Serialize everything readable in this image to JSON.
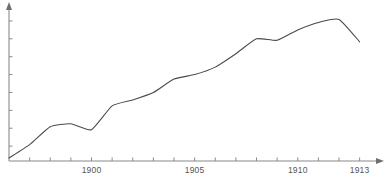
{
  "chart_data": {
    "type": "line",
    "title": "",
    "subtitle": "",
    "xlabel": "",
    "ylabel": "",
    "legend": [],
    "legend_position": "none",
    "grid": false,
    "xlim": [
      1896,
      1913.6
    ],
    "ylim": [
      0,
      100
    ],
    "x_tick_labels": [
      "1900",
      "1905",
      "1910",
      "1913"
    ],
    "x_tick_values": [
      1900,
      1905,
      1910,
      1913
    ],
    "x_minor_ticks": [
      1897,
      1898,
      1899,
      1900,
      1901,
      1902,
      1903,
      1904,
      1905,
      1906,
      1907,
      1908,
      1909,
      1910,
      1911,
      1912,
      1913
    ],
    "y_tick_labels": [],
    "y_tick_values": [
      10,
      22,
      34,
      46,
      58,
      70,
      82,
      94
    ],
    "series": [
      {
        "name": "series-1",
        "color": "#4a4a4a",
        "x": [
          1896,
          1897,
          1898,
          1899,
          1900,
          1901,
          1902,
          1903,
          1904,
          1905,
          1906,
          1907,
          1908,
          1909,
          1910,
          1911,
          1912,
          1913
        ],
        "values": [
          2,
          11,
          23,
          25,
          21,
          37,
          41,
          46,
          55,
          58,
          63,
          72,
          82,
          81,
          88,
          93,
          95,
          80
        ]
      }
    ],
    "annotations": []
  },
  "axis": {
    "x_axis_name": "x-axis",
    "y_axis_name": "y-axis",
    "arrow_x": "arrow-right",
    "arrow_y": "arrow-up"
  }
}
